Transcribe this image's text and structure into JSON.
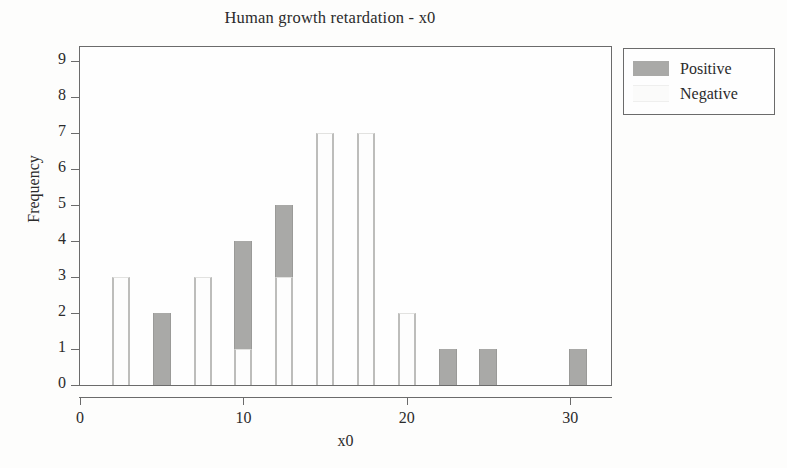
{
  "chart_data": {
    "type": "bar",
    "subtype": "stacked-histogram",
    "title": "Human growth retardation - x0",
    "xlabel": "x0",
    "ylabel": "Frequency",
    "xlim": [
      0,
      32.5
    ],
    "ylim": [
      0,
      9.4
    ],
    "xticks": [
      0,
      10,
      20,
      30
    ],
    "yticks": [
      0,
      1,
      2,
      3,
      4,
      5,
      6,
      7,
      8,
      9
    ],
    "grid": false,
    "legend_position": "outside-top-right",
    "series": [
      {
        "name": "Positive",
        "color": "#a9a9a7",
        "values": [
          2,
          2,
          2,
          4,
          5,
          2,
          1,
          0,
          1,
          1,
          1
        ]
      },
      {
        "name": "Negative",
        "color": "#fbfbfa",
        "values": [
          3,
          0,
          3,
          1,
          3,
          7,
          7,
          2,
          0,
          0,
          0
        ]
      }
    ],
    "x": [
      2.5,
      5.0,
      7.5,
      10.0,
      12.5,
      15.0,
      17.5,
      20.0,
      22.5,
      25.0,
      30.5
    ],
    "bin_width": 1.1,
    "legend": [
      {
        "label": "Positive",
        "swatch": "positive-swatch"
      },
      {
        "label": "Negative",
        "swatch": "negative-swatch"
      }
    ]
  }
}
